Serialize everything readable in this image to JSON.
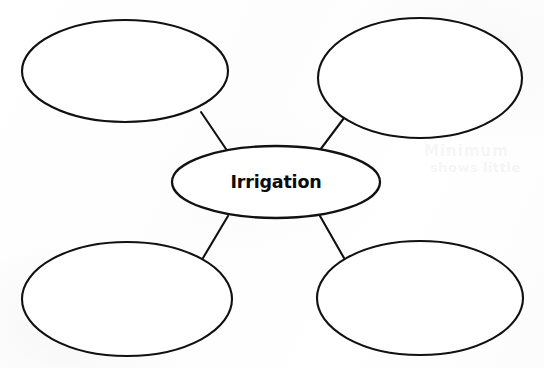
{
  "page": {
    "background_color": "#ffffff",
    "ink_color": "#111111",
    "width": 544,
    "height": 368
  },
  "diagram": {
    "type": "concept-web",
    "center": {
      "label": "Irrigation",
      "cx": 276,
      "cy": 182,
      "rx": 104,
      "ry": 36
    },
    "branches": [
      {
        "id": "top-left",
        "label": "",
        "cx": 125,
        "cy": 71,
        "rx": 103,
        "ry": 51,
        "connector": {
          "x1": 201,
          "y1": 112,
          "x2": 226,
          "y2": 149
        }
      },
      {
        "id": "top-right",
        "label": "",
        "cx": 420,
        "cy": 78,
        "rx": 102,
        "ry": 60,
        "connector": {
          "x1": 344,
          "y1": 118,
          "x2": 320,
          "y2": 150
        }
      },
      {
        "id": "bottom-left",
        "label": "",
        "cx": 127,
        "cy": 299,
        "rx": 105,
        "ry": 57,
        "connector": {
          "x1": 203,
          "y1": 258,
          "x2": 228,
          "y2": 216
        }
      },
      {
        "id": "bottom-right",
        "label": "",
        "cx": 420,
        "cy": 298,
        "rx": 103,
        "ry": 57,
        "connector": {
          "x1": 344,
          "y1": 258,
          "x2": 320,
          "y2": 216
        }
      }
    ]
  },
  "artifacts": {
    "ghost_text_line_1": "Minimum",
    "ghost_text_line_2": "shows little"
  }
}
